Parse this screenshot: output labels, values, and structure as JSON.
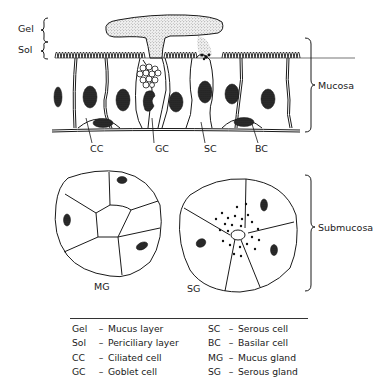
{
  "diagram": {
    "layer_labels": {
      "gel": "Gel",
      "sol": "Sol"
    },
    "region_labels": {
      "mucosa": "Mucosa",
      "submucosa": "Submucosa"
    },
    "cell_labels": {
      "cc": "CC",
      "gc": "GC",
      "sc": "SC",
      "bc": "BC"
    },
    "gland_labels": {
      "mg": "MG",
      "sg": "SG"
    }
  },
  "legend": {
    "left": [
      {
        "abbr": "Gel",
        "dash": "–",
        "text": "Mucus layer"
      },
      {
        "abbr": "Sol",
        "dash": "–",
        "text": "Periciliary layer"
      },
      {
        "abbr": "CC",
        "dash": "–",
        "text": "Ciliated cell"
      },
      {
        "abbr": "GC",
        "dash": "–",
        "text": "Goblet cell"
      }
    ],
    "right": [
      {
        "abbr": "SC",
        "dash": "–",
        "text": "Serous cell"
      },
      {
        "abbr": "BC",
        "dash": "–",
        "text": "Basilar cell"
      },
      {
        "abbr": "MG",
        "dash": "–",
        "text": "Mucus gland"
      },
      {
        "abbr": "SG",
        "dash": "–",
        "text": "Serous gland"
      }
    ]
  },
  "colors": {
    "ink": "#1a1a1a",
    "stipple": "#9a9a9a",
    "background": "#ffffff"
  }
}
